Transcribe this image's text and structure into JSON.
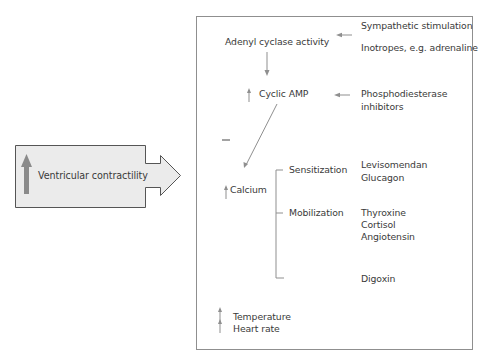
{
  "left_panel": {
    "label": "Ventricular contractility",
    "indicator": "up-arrow",
    "fill_color": "#ebebeb",
    "arrow_color": "#8a8a8a"
  },
  "pathway": {
    "adenyl_cyclase": "Adenyl cyclase activity",
    "cyclic_amp": "Cyclic AMP",
    "calcium": "Calcium",
    "inhibition_mark": "—",
    "temperature": "Temperature",
    "heart_rate": "Heart rate"
  },
  "stimuli": {
    "sympathetic": "Sympathetic stimulation",
    "inotropes": "Inotropes, e.g. adrenaline",
    "pde_line1": "Phosphodiesterase",
    "pde_line2": "inhibitors"
  },
  "calcium_branches": {
    "sensitization": {
      "label": "Sensitization",
      "agents": [
        "Levisomendan",
        "Glucagon"
      ]
    },
    "mobilization": {
      "label": "Mobilization",
      "agents": [
        "Thyroxine",
        "Cortisol",
        "Angiotensin"
      ]
    },
    "other": {
      "agents": [
        "Digoxin"
      ]
    }
  },
  "colors": {
    "line": "#8f8f8f",
    "text": "#3a3a3a"
  }
}
